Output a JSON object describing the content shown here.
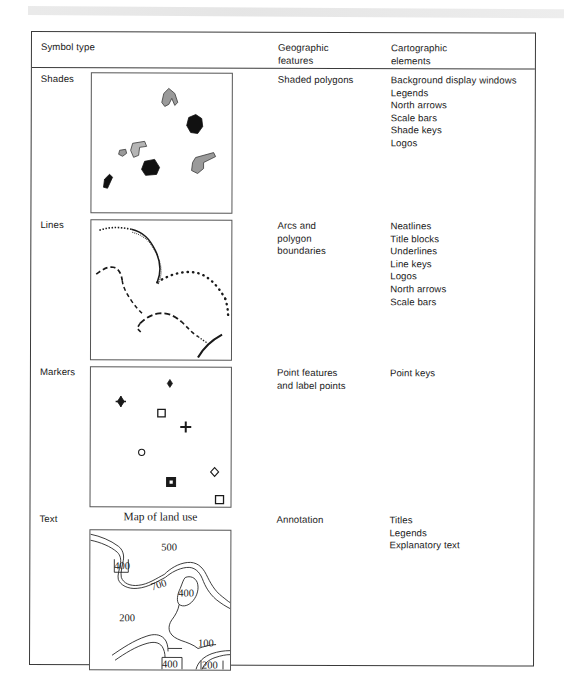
{
  "table": {
    "headers": {
      "col1": "Symbol type",
      "col2": "Geographic\nfeatures",
      "col3": "Cartographic\nelements"
    },
    "rows": [
      {
        "symbol_type": "Shades",
        "geographic_features": "Shaded polygons",
        "cartographic_elements": "Background display windows\nLegends\nNorth arrows\nScale bars\nShade keys\nLogos"
      },
      {
        "symbol_type": "Lines",
        "geographic_features": "Arcs and\npolygon\nboundaries",
        "cartographic_elements": "Neatlines\nTitle blocks\nUnderlines\nLine keys\nLogos\nNorth arrows\nScale bars"
      },
      {
        "symbol_type": "Markers",
        "geographic_features": "Point features\nand label points",
        "cartographic_elements": "Point keys"
      },
      {
        "symbol_type": "Text",
        "geographic_features": "Annotation",
        "cartographic_elements": "Titles\nLegends\nExplanatory text"
      }
    ]
  },
  "figures": {
    "shades": {
      "caption": "",
      "fill_dark": "#111111",
      "fill_light": "#9a9a9a"
    },
    "lines": {
      "caption": ""
    },
    "markers": {
      "caption": ""
    },
    "text_map": {
      "title": "Map of land use",
      "contour_labels": [
        "500",
        "400",
        "700",
        "400",
        "200",
        "100",
        "400",
        "200"
      ]
    }
  }
}
